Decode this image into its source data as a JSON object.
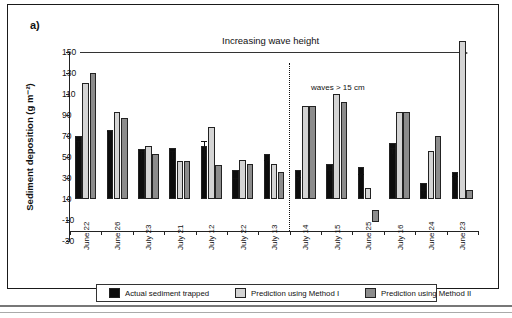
{
  "figure": {
    "panel_label": "a)",
    "annotation_arrow": "Increasing wave height",
    "annotation_divider": "waves > 15 cm"
  },
  "chart_data": {
    "type": "bar",
    "title": "",
    "xlabel": "",
    "ylabel": "Sediment deposition (g m⁻²)",
    "ylim": [
      -30,
      150
    ],
    "yticks": [
      150,
      130,
      110,
      90,
      70,
      50,
      30,
      10,
      -10,
      -30
    ],
    "grid": false,
    "legend_position": "bottom",
    "categories": [
      "June 22",
      "June 26",
      "July 23",
      "July 21",
      "July 12",
      "July 22",
      "July 13",
      "July 14",
      "July 15",
      "June 25",
      "July 16",
      "June 24",
      "June 23"
    ],
    "series": [
      {
        "name": "Actual sediment trapped",
        "color": "#0d0d0d",
        "values": [
          60,
          65,
          47,
          48,
          50,
          27,
          42,
          27,
          33,
          30,
          53,
          15,
          25
        ],
        "errors": [
          5,
          10,
          9,
          8,
          15,
          3,
          5,
          4,
          5,
          4,
          6,
          4,
          7
        ]
      },
      {
        "name": "Prediction using Method I",
        "color": "#d4d4d4",
        "values": [
          110,
          82,
          50,
          36,
          68,
          37,
          33,
          88,
          100,
          10,
          82,
          45,
          168
        ],
        "errors": [
          0,
          0,
          0,
          0,
          0,
          0,
          0,
          0,
          0,
          0,
          0,
          0,
          0
        ]
      },
      {
        "name": "Prediction using Method II",
        "color": "#8c8c8c",
        "values": [
          120,
          77,
          42,
          36,
          32,
          33,
          25,
          88,
          92,
          -12,
          82,
          60,
          8
        ],
        "errors": [
          0,
          0,
          0,
          0,
          0,
          0,
          0,
          0,
          0,
          0,
          0,
          0,
          0
        ]
      }
    ]
  }
}
